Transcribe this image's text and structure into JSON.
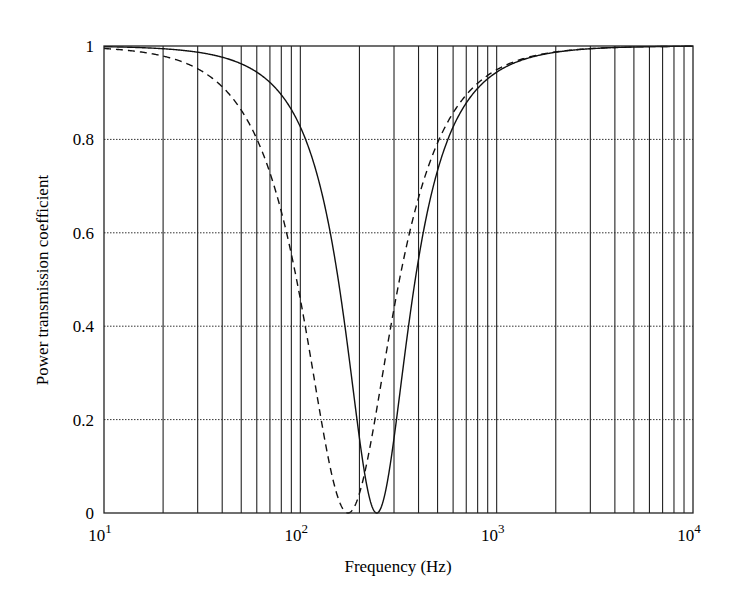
{
  "chart_data": {
    "type": "line",
    "title": "",
    "xlabel": "Frequency (Hz)",
    "ylabel": "Power transmission coefficient",
    "xscale": "log",
    "xlim": [
      10,
      10000
    ],
    "ylim": [
      0,
      1
    ],
    "xticks": [
      {
        "base": "10",
        "exp": "1"
      },
      {
        "base": "10",
        "exp": "2"
      },
      {
        "base": "10",
        "exp": "3"
      },
      {
        "base": "10",
        "exp": "4"
      }
    ],
    "yticks": [
      "0",
      "0.2",
      "0.4",
      "0.6",
      "0.8",
      "1"
    ],
    "grid": {
      "vertical_minor_log": true,
      "horizontal": "dotted"
    },
    "legend": null,
    "series": [
      {
        "name": "solid",
        "style": "solid",
        "model": {
          "f0": 245,
          "Q": 1.07
        },
        "points": [
          [
            10,
            0.998
          ],
          [
            50,
            0.97
          ],
          [
            80,
            0.9
          ],
          [
            108,
            0.8
          ],
          [
            145,
            0.6
          ],
          [
            175,
            0.4
          ],
          [
            200,
            0.2
          ],
          [
            245,
            0.0
          ],
          [
            290,
            0.2
          ],
          [
            340,
            0.4
          ],
          [
            420,
            0.6
          ],
          [
            580,
            0.8
          ],
          [
            1000,
            0.94
          ],
          [
            10000,
            1.0
          ]
        ]
      },
      {
        "name": "dashed",
        "style": "dashed",
        "model": {
          "f0": 175,
          "Q": 0.78
        },
        "points": [
          [
            10,
            0.99
          ],
          [
            30,
            0.93
          ],
          [
            59,
            0.8
          ],
          [
            75,
            0.6
          ],
          [
            93,
            0.4
          ],
          [
            120,
            0.2
          ],
          [
            175,
            0.0
          ],
          [
            225,
            0.2
          ],
          [
            290,
            0.4
          ],
          [
            390,
            0.6
          ],
          [
            490,
            0.8
          ],
          [
            1000,
            0.96
          ],
          [
            10000,
            1.0
          ]
        ]
      }
    ]
  }
}
